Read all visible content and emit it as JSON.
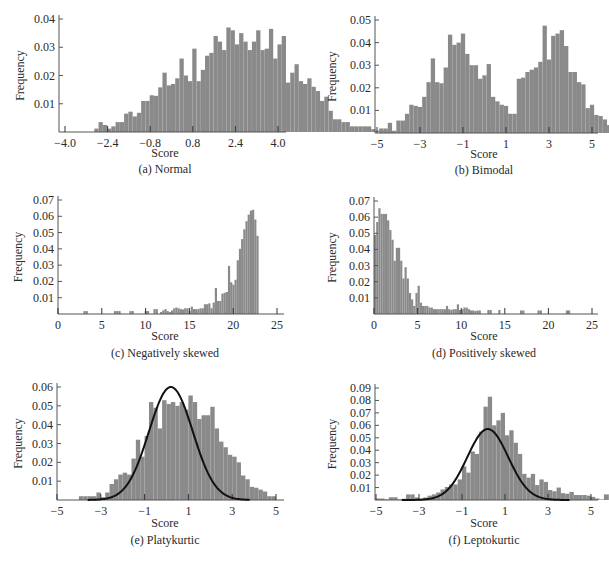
{
  "figure": {
    "bar_color": "#8a8a8a",
    "axis_color": "#555555",
    "curve_color": "#111111"
  },
  "chart_data": [
    {
      "id": "a",
      "type": "bar",
      "title": "(a) Normal",
      "xlabel": "Score",
      "ylabel": "Frequency",
      "xlim": [
        -4.4,
        4.3
      ],
      "ylim": [
        0,
        0.041
      ],
      "xticks": [
        -4.0,
        -2.4,
        -0.8,
        0.8,
        2.4,
        4.0
      ],
      "xtick_labels": [
        "−4.0",
        "−2.4",
        "−0.8",
        "0.8",
        "2.4",
        "4.0"
      ],
      "yticks": [
        0.01,
        0.02,
        0.03,
        0.04
      ],
      "ytick_labels": [
        "0.01",
        "0.02",
        "0.03",
        "0.04"
      ],
      "bin_start": -2.9,
      "bin_width": 0.16,
      "values": [
        0.0012,
        0.0035,
        0.0025,
        0.0012,
        0.002,
        0.0035,
        0.0035,
        0.0065,
        0.0072,
        0.0055,
        0.0068,
        0.011,
        0.011,
        0.013,
        0.0128,
        0.0158,
        0.021,
        0.0165,
        0.017,
        0.019,
        0.026,
        0.02,
        0.018,
        0.0295,
        0.018,
        0.022,
        0.027,
        0.028,
        0.034,
        0.032,
        0.029,
        0.037,
        0.036,
        0.031,
        0.035,
        0.032,
        0.029,
        0.032,
        0.036,
        0.029,
        0.0295,
        0.0365,
        0.026,
        0.031,
        0.034,
        0.0175,
        0.021,
        0.024,
        0.018,
        0.017,
        0.019,
        0.016,
        0.0145,
        0.011,
        0.0125,
        0.0075,
        0.0045,
        0.0045,
        0.0035,
        0.0035,
        0.002,
        0.002,
        0.002,
        0.002,
        0.002,
        0.001,
        0.0005,
        0.0003,
        0.0003
      ],
      "grid": false
    },
    {
      "id": "b",
      "type": "bar",
      "title": "(b) Bimodal",
      "xlabel": "Score",
      "ylabel": "Frequency",
      "xlim": [
        -5.1,
        5.3
      ],
      "ylim": [
        0,
        0.051
      ],
      "xticks": [
        -5,
        -3,
        -1,
        1,
        3,
        5
      ],
      "xtick_labels": [
        "−5",
        "−3",
        "−1",
        "1",
        "3",
        "5"
      ],
      "yticks": [
        0.01,
        0.02,
        0.03,
        0.04,
        0.05
      ],
      "ytick_labels": [
        "0.01",
        "0.02",
        "0.03",
        "0.04",
        "0.05"
      ],
      "bin_start": -4.9,
      "bin_width": 0.2,
      "values": [
        0.002,
        0.002,
        0.0045,
        0.001,
        0.0055,
        0.0055,
        0.0085,
        0.0125,
        0.012,
        0.0115,
        0.016,
        0.0225,
        0.033,
        0.0225,
        0.022,
        0.029,
        0.0435,
        0.039,
        0.04,
        0.044,
        0.035,
        0.03,
        0.03,
        0.024,
        0.0255,
        0.0305,
        0.016,
        0.014,
        0.0125,
        0.012,
        0.0085,
        0.0085,
        0.024,
        0.0245,
        0.027,
        0.028,
        0.029,
        0.0315,
        0.0475,
        0.0325,
        0.043,
        0.044,
        0.0455,
        0.0385,
        0.027,
        0.027,
        0.0225,
        0.0215,
        0.011,
        0.0125,
        0.008,
        0.0075,
        0.006,
        0.0035,
        0.0025
      ],
      "grid": false
    },
    {
      "id": "c",
      "type": "bar",
      "title": "(c) Negatively skewed",
      "xlabel": "Score",
      "ylabel": "Frequency",
      "xlim": [
        0,
        25.5
      ],
      "ylim": [
        0,
        0.071
      ],
      "xticks": [
        0,
        5,
        10,
        15,
        20,
        25
      ],
      "xtick_labels": [
        "0",
        "5",
        "10",
        "15",
        "20",
        "25"
      ],
      "yticks": [
        0.01,
        0.02,
        0.03,
        0.04,
        0.05,
        0.06,
        0.07
      ],
      "ytick_labels": [
        "0.01",
        "0.02",
        "0.03",
        "0.04",
        "0.05",
        "0.06",
        "0.07"
      ],
      "bin_start": 2.9,
      "bin_width": 0.25,
      "values": [
        0.0018,
        0.0018,
        0,
        0,
        0,
        0,
        0,
        0,
        0,
        0,
        0,
        0,
        0,
        0,
        0.0018,
        0.0018,
        0.0018,
        0,
        0,
        0,
        0,
        0.0018,
        0.0018,
        0,
        0,
        0,
        0,
        0,
        0.0018,
        0.0018,
        0,
        0,
        0.003,
        0.003,
        0,
        0.0012,
        0.0022,
        0.003,
        0.0018,
        0.0012,
        0.0022,
        0.0035,
        0.004,
        0.0035,
        0.003,
        0.0028,
        0.0035,
        0.0035,
        0.0018,
        0.0045,
        0.003,
        0.003,
        0.003,
        0.0035,
        0.0035,
        0.006,
        0.006,
        0.0065,
        0.0035,
        0.007,
        0.016,
        0.008,
        0.008,
        0.0125,
        0.013,
        0.0135,
        0.0295,
        0.0195,
        0.018,
        0.021,
        0.033,
        0.04,
        0.046,
        0.052,
        0.057,
        0.061,
        0.0635,
        0.064,
        0.058,
        0.048
      ],
      "grid": false
    },
    {
      "id": "d",
      "type": "bar",
      "title": "(d) Positively skewed",
      "xlabel": "Score",
      "ylabel": "Frequency",
      "xlim": [
        0,
        25.5
      ],
      "ylim": [
        0,
        0.071
      ],
      "xticks": [
        0,
        5,
        10,
        15,
        20,
        25
      ],
      "xtick_labels": [
        "0",
        "5",
        "10",
        "15",
        "20",
        "25"
      ],
      "yticks": [
        0.01,
        0.02,
        0.03,
        0.04,
        0.05,
        0.06,
        0.07
      ],
      "ytick_labels": [
        "0.01",
        "0.02",
        "0.03",
        "0.04",
        "0.05",
        "0.06",
        "0.07"
      ],
      "bin_start": 0,
      "bin_width": 0.25,
      "values": [
        0.049,
        0.057,
        0.0655,
        0.062,
        0.062,
        0.062,
        0.058,
        0.052,
        0.046,
        0.033,
        0.041,
        0.041,
        0.033,
        0.022,
        0.029,
        0.022,
        0.013,
        0.009,
        0.005,
        0.013,
        0.0175,
        0.007,
        0.005,
        0.005,
        0.005,
        0.004,
        0.004,
        0.003,
        0.003,
        0.003,
        0.003,
        0.003,
        0.003,
        0.005,
        0.003,
        0.0025,
        0.003,
        0.003,
        0.006,
        0.0025,
        0.003,
        0.004,
        0.004,
        0.003,
        0.0022,
        0.0022,
        0.0018,
        0.0022,
        0.0022,
        0,
        0,
        0,
        0.0025,
        0.0025,
        0,
        0,
        0,
        0.0025,
        0,
        0,
        0,
        0,
        0,
        0,
        0,
        0,
        0,
        0.0022,
        0.0022,
        0,
        0,
        0,
        0,
        0,
        0,
        0.0022,
        0.0022,
        0,
        0,
        0,
        0,
        0,
        0,
        0,
        0,
        0,
        0,
        0,
        0.0022,
        0.0022
      ],
      "grid": false
    },
    {
      "id": "e",
      "type": "bar",
      "title": "(e) Platykurtic",
      "xlabel": "Score",
      "ylabel": "Frequency",
      "xlim": [
        -5.1,
        5.4
      ],
      "ylim": [
        0,
        0.061
      ],
      "xticks": [
        -5,
        -3,
        -1,
        1,
        3,
        5
      ],
      "xtick_labels": [
        "−5",
        "−3",
        "−1",
        "1",
        "3",
        "5"
      ],
      "yticks": [
        0.01,
        0.02,
        0.03,
        0.04,
        0.05,
        0.06
      ],
      "ytick_labels": [
        "0.01",
        "0.02",
        "0.03",
        "0.04",
        "0.05",
        "0.06"
      ],
      "bin_start": -4.0,
      "bin_width": 0.2,
      "values": [
        0.002,
        0.002,
        0.002,
        0.002,
        0.004,
        0.0015,
        0.004,
        0.0085,
        0.011,
        0.0135,
        0.0145,
        0.0135,
        0.022,
        0.032,
        0.023,
        0.034,
        0.052,
        0.049,
        0.038,
        0.053,
        0.051,
        0.052,
        0.05,
        0.052,
        0.048,
        0.0555,
        0.052,
        0.043,
        0.045,
        0.045,
        0.0495,
        0.038,
        0.031,
        0.028,
        0.024,
        0.023,
        0.02,
        0.013,
        0.011,
        0.007,
        0.0065,
        0.0055,
        0.0045,
        0.002,
        0.002
      ],
      "curve": {
        "type": "normal",
        "mean": 0.2,
        "sd": 1.0,
        "peak": 0.06,
        "x_range": [
          -3.6,
          3.8
        ]
      },
      "grid": false
    },
    {
      "id": "f",
      "type": "bar",
      "title": "(f) Leptokurtic",
      "xlabel": "Score",
      "ylabel": "Frequency",
      "xlim": [
        -5.1,
        5.3
      ],
      "ylim": [
        0,
        0.091
      ],
      "xticks": [
        -5,
        -3,
        -1,
        1,
        3,
        5
      ],
      "xtick_labels": [
        "−5",
        "−3",
        "−1",
        "1",
        "3",
        "5"
      ],
      "yticks": [
        0.01,
        0.02,
        0.03,
        0.04,
        0.05,
        0.06,
        0.07,
        0.08,
        0.09
      ],
      "ytick_labels": [
        "0.01",
        "0.02",
        "0.03",
        "0.04",
        "0.05",
        "0.06",
        "0.07",
        "0.08",
        "0.09"
      ],
      "bin_start": -5.0,
      "bin_width": 0.2,
      "values": [
        0.0012,
        0.0012,
        0.0005,
        0.0022,
        0.0022,
        0.0005,
        0.001,
        0.0045,
        0.0045,
        0.002,
        0.001,
        0.002,
        0.0035,
        0.0045,
        0.006,
        0.0085,
        0.0105,
        0.0125,
        0.0125,
        0.0165,
        0.027,
        0.022,
        0.039,
        0.037,
        0.055,
        0.075,
        0.083,
        0.06,
        0.064,
        0.07,
        0.052,
        0.056,
        0.046,
        0.037,
        0.021,
        0.018,
        0.021,
        0.012,
        0.0165,
        0.0145,
        0.008,
        0.007,
        0.01,
        0.0055,
        0.005,
        0.0065,
        0.004,
        0.004,
        0.004,
        0.0035,
        0.0025,
        0.0012,
        0.0005,
        0.0045,
        0.0045
      ],
      "curve": {
        "type": "normal",
        "mean": 0.2,
        "sd": 0.95,
        "peak": 0.057,
        "x_range": [
          -3.8,
          4.0
        ]
      },
      "grid": false
    }
  ],
  "panels": {
    "a": {
      "caption": "(a) Normal",
      "xlabel": "Score",
      "ylabel": "Frequency"
    },
    "b": {
      "caption": "(b) Bimodal",
      "xlabel": "Score",
      "ylabel": "Frequency"
    },
    "c": {
      "caption": "(c) Negatively skewed",
      "xlabel": "Score",
      "ylabel": "Frequency"
    },
    "d": {
      "caption": "(d) Positively skewed",
      "xlabel": "Score",
      "ylabel": "Frequency"
    },
    "e": {
      "caption": "(e) Platykurtic",
      "xlabel": "Score",
      "ylabel": "Frequency"
    },
    "f": {
      "caption": "(f) Leptokurtic",
      "xlabel": "Score",
      "ylabel": "Frequency"
    }
  },
  "layout": {
    "a": {
      "x0": 59,
      "x1": 286,
      "xmap": [
        -4.0,
        65,
        4.0,
        278
      ],
      "ytop": 19,
      "base": 132,
      "ylab_x": 24,
      "cap_cx": 165,
      "score_y": 157,
      "cap_y": 170
    },
    "b": {
      "x0": 375,
      "x1": 598,
      "xmap": [
        -5,
        377,
        5,
        592
      ],
      "ytop": 20,
      "base": 133,
      "ylab_x": 336,
      "cap_cx": 484,
      "score_y": 158,
      "cap_y": 171
    },
    "c": {
      "x0": 58,
      "x1": 284,
      "xmap": [
        0,
        58,
        25,
        277
      ],
      "ytop": 200,
      "base": 314,
      "ylab_x": 22,
      "cap_cx": 165,
      "score_y": 340,
      "cap_y": 354
    },
    "d": {
      "x0": 374,
      "x1": 598,
      "xmap": [
        0,
        374,
        25,
        592
      ],
      "ytop": 201,
      "base": 314,
      "ylab_x": 336,
      "cap_cx": 484,
      "score_y": 340,
      "cap_y": 354
    },
    "e": {
      "x0": 57,
      "x1": 284,
      "xmap": [
        -5,
        57,
        5,
        276
      ],
      "ytop": 387,
      "base": 500,
      "ylab_x": 22,
      "cap_cx": 165,
      "score_y": 527,
      "cap_y": 541
    },
    "f": {
      "x0": 375,
      "x1": 598,
      "xmap": [
        -5,
        376,
        5,
        591
      ],
      "ytop": 388,
      "base": 500,
      "ylab_x": 336,
      "cap_cx": 484,
      "score_y": 527,
      "cap_y": 541
    }
  }
}
